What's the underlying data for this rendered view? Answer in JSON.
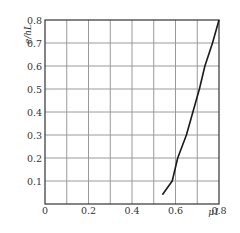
{
  "chart_data": {
    "type": "line",
    "title": "",
    "xlabel": "μ1",
    "ylabel": "e/hL",
    "xlim": [
      0,
      0.8
    ],
    "ylim": [
      0,
      0.8
    ],
    "grid": true,
    "legend": null,
    "x_ticks": [
      "0",
      "0.2",
      "0.4",
      "0.6",
      "0.8"
    ],
    "x_tick_values": [
      0,
      0.2,
      0.4,
      0.6,
      0.8
    ],
    "y_ticks": [
      "0.1",
      "0.2",
      "0.3",
      "0.4",
      "0.5",
      "0.6",
      "0.7",
      "0.8"
    ],
    "y_tick_values": [
      0.1,
      0.2,
      0.3,
      0.4,
      0.5,
      0.6,
      0.7,
      0.8
    ],
    "x_grid_step": 0.1,
    "y_grid_step": 0.1,
    "series": [
      {
        "name": "e/hL vs μ1",
        "x": [
          0.54,
          0.585,
          0.61,
          0.65,
          0.68,
          0.71,
          0.735,
          0.77,
          0.8
        ],
        "y": [
          0.04,
          0.1,
          0.2,
          0.3,
          0.4,
          0.5,
          0.6,
          0.7,
          0.8
        ]
      }
    ]
  },
  "colors": {
    "grid": "#9a9a9a",
    "frame": "#333333",
    "curve": "#1a1a1a",
    "text": "#333333"
  }
}
